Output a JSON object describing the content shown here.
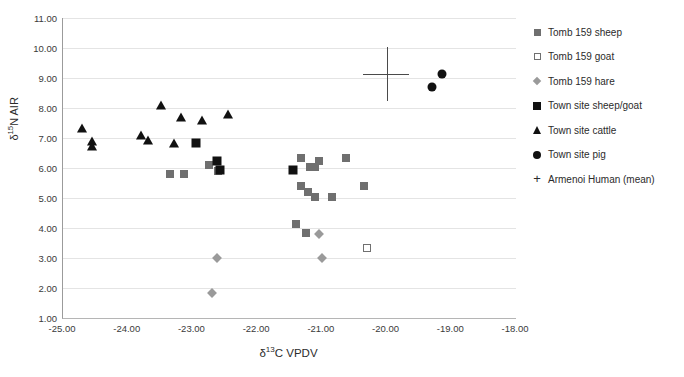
{
  "chart_data": {
    "type": "scatter",
    "title": "",
    "xlabel": "δ¹³C VPDV",
    "ylabel": "δ¹⁵N AIR",
    "xlim": [
      -25.0,
      -18.0
    ],
    "ylim": [
      1.0,
      11.0
    ],
    "xticks": [
      "-25.00",
      "-24.00",
      "-23.00",
      "-22.00",
      "-21.00",
      "-20.00",
      "-19.00",
      "-18.00"
    ],
    "yticks": [
      "1.00",
      "2.00",
      "3.00",
      "4.00",
      "5.00",
      "6.00",
      "7.00",
      "8.00",
      "9.00",
      "10.00",
      "11.00"
    ],
    "grid": "horizontal",
    "legend_position": "right",
    "series": [
      {
        "name": "Tomb 159 sheep",
        "marker": "filled-square",
        "color": "#6f6f6f",
        "points": [
          [
            -23.34,
            5.8
          ],
          [
            -23.13,
            5.8
          ],
          [
            -22.74,
            6.1
          ],
          [
            -22.6,
            5.9
          ],
          [
            -21.33,
            6.35
          ],
          [
            -21.18,
            6.05
          ],
          [
            -21.1,
            6.05
          ],
          [
            -21.05,
            6.25
          ],
          [
            -20.62,
            6.35
          ],
          [
            -21.32,
            5.4
          ],
          [
            -21.22,
            5.2
          ],
          [
            -21.1,
            5.05
          ],
          [
            -20.85,
            5.05
          ],
          [
            -20.35,
            5.4
          ],
          [
            -21.4,
            4.15
          ],
          [
            -21.25,
            3.85
          ]
        ]
      },
      {
        "name": "Tomb 159 goat",
        "marker": "open-square",
        "color": "#707070",
        "points": [
          [
            -20.3,
            3.35
          ]
        ]
      },
      {
        "name": "Tomb 159 hare",
        "marker": "diamond",
        "color": "#9a9a9a",
        "points": [
          [
            -22.62,
            3.0
          ],
          [
            -21.0,
            3.0
          ],
          [
            -21.05,
            3.8
          ],
          [
            -22.7,
            1.85
          ]
        ]
      },
      {
        "name": "Town site sheep/goat",
        "marker": "filled-square",
        "color": "#111111",
        "points": [
          [
            -22.95,
            6.85
          ],
          [
            -22.62,
            6.25
          ],
          [
            -22.58,
            5.95
          ],
          [
            -21.45,
            5.95
          ]
        ]
      },
      {
        "name": "Town site cattle",
        "marker": "triangle",
        "color": "#111111",
        "points": [
          [
            -24.7,
            7.35
          ],
          [
            -24.55,
            6.9
          ],
          [
            -24.55,
            6.75
          ],
          [
            -23.8,
            7.1
          ],
          [
            -23.68,
            6.95
          ],
          [
            -23.48,
            8.1
          ],
          [
            -23.18,
            7.7
          ],
          [
            -23.28,
            6.85
          ],
          [
            -22.85,
            7.6
          ],
          [
            -22.45,
            7.8
          ]
        ]
      },
      {
        "name": "Town site pig",
        "marker": "circle",
        "color": "#111111",
        "points": [
          [
            -19.15,
            9.15
          ],
          [
            -19.3,
            8.7
          ]
        ]
      },
      {
        "name": "Armenoi Human (mean)",
        "marker": "plus-with-errorbars",
        "color": "#4a4a4a",
        "points": [
          [
            -20.0,
            9.15
          ]
        ],
        "x_error": [
          -20.37,
          -19.65
        ],
        "y_error": [
          8.25,
          10.05
        ]
      }
    ]
  },
  "legend": {
    "items": [
      {
        "label": "Tomb 159 sheep",
        "key": "filled-square-grey-icon"
      },
      {
        "label": "Tomb 159 goat",
        "key": "open-square-icon"
      },
      {
        "label": "Tomb 159 hare",
        "key": "diamond-grey-icon"
      },
      {
        "label": "Town site sheep/goat",
        "key": "filled-square-black-icon"
      },
      {
        "label": "Town site cattle",
        "key": "triangle-black-icon"
      },
      {
        "label": "Town site pig",
        "key": "circle-black-icon"
      },
      {
        "label": "Armenoi Human (mean)",
        "key": "plus-icon"
      }
    ]
  },
  "axes": {
    "y_title_main": "N AIR",
    "y_title_delta": "δ",
    "y_title_sup": "15",
    "x_title_delta": "δ",
    "x_title_sup": "13",
    "x_title_main": "C VPDV"
  }
}
